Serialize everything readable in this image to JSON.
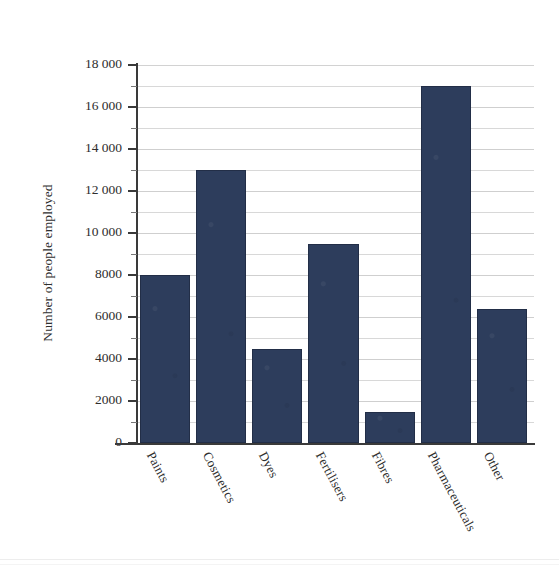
{
  "chart_data": {
    "type": "bar",
    "title": "",
    "xlabel": "",
    "ylabel": "Number of people employed",
    "categories": [
      "Paints",
      "Cosmetics",
      "Dyes",
      "Fertilisers",
      "Fibres",
      "Pharmaceuticals",
      "Other"
    ],
    "values": [
      8000,
      13000,
      4500,
      9500,
      1500,
      17000,
      6400
    ],
    "ylim": [
      0,
      18000
    ],
    "ytick_values": [
      0,
      2000,
      4000,
      6000,
      8000,
      10000,
      12000,
      14000,
      16000,
      18000
    ],
    "ytick_labels": [
      "0",
      "2000",
      "4000",
      "6000",
      "8000",
      "10 000",
      "12 000",
      "14 000",
      "16 000",
      "18 000"
    ],
    "minor_tick_interval": 1000,
    "grid": "horizontal",
    "legend": "none",
    "bar_color": "#2d3d5c",
    "grid_color": "#d8d8d8",
    "axis_color": "#3a3a3a",
    "xlabel_rotation_deg": -62
  },
  "axes": {
    "y_title": "Number of people employed"
  }
}
